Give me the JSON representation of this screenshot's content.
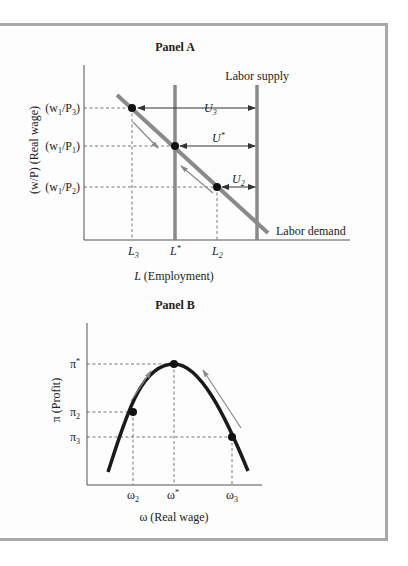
{
  "panel_a": {
    "title": "Panel A",
    "y_axis_label": "(w/P) (Real wage)",
    "x_axis_label": "(Employment)",
    "x_axis_var": "L",
    "y_ticks": [
      {
        "base": "(w",
        "sub1": "1",
        "mid": "/P",
        "sub2": "3",
        "end": ")"
      },
      {
        "base": "(w",
        "sub1": "1",
        "mid": "/P",
        "sub2": "1",
        "end": ")"
      },
      {
        "base": "(w",
        "sub1": "1",
        "mid": "/P",
        "sub2": "2",
        "end": ")"
      }
    ],
    "x_ticks": [
      {
        "base": "L",
        "sub": "3",
        "sup": ""
      },
      {
        "base": "L",
        "sub": "",
        "sup": "*"
      },
      {
        "base": "L",
        "sub": "2",
        "sup": ""
      }
    ],
    "supply_label": "Labor supply",
    "demand_label": "Labor demand",
    "unemployment_labels": [
      {
        "base": "U",
        "sub": "3",
        "sup": ""
      },
      {
        "base": "U",
        "sub": "",
        "sup": "*"
      },
      {
        "base": "U",
        "sub": "2",
        "sup": ""
      }
    ]
  },
  "panel_b": {
    "title": "Panel B",
    "y_axis_label": "π (Profit)",
    "x_axis_label": "ω (Real wage)",
    "y_ticks": [
      {
        "base": "π",
        "sub": "",
        "sup": "*"
      },
      {
        "base": "π",
        "sub": "2",
        "sup": ""
      },
      {
        "base": "π",
        "sub": "3",
        "sup": ""
      }
    ],
    "x_ticks": [
      {
        "base": "ω",
        "sub": "2",
        "sup": ""
      },
      {
        "base": "ω",
        "sub": "",
        "sup": "*"
      },
      {
        "base": "ω",
        "sub": "3",
        "sup": ""
      }
    ]
  },
  "colors": {
    "curve_gray": "#8a8a8a",
    "curve_black": "#1a1a1a",
    "axis": "#555555",
    "arrow_gray": "#909090",
    "frame": "#a9a9a9"
  }
}
